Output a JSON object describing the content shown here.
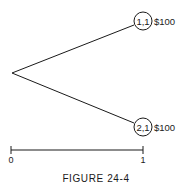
{
  "figure": {
    "caption": "FIGURE 24-4",
    "root": {
      "x": 12,
      "y": 73
    },
    "nodes": [
      {
        "id": "node-1-1",
        "label": "1,1",
        "value": "$100",
        "cx": 143,
        "cy": 21
      },
      {
        "id": "node-2-1",
        "label": "2,1",
        "value": "$100",
        "cx": 143,
        "cy": 127
      }
    ],
    "scale": {
      "start_label": "0",
      "end_label": "1",
      "x0": 11,
      "x1": 143,
      "y": 150
    }
  },
  "colors": {
    "ink": "#1a1a1a",
    "background": "#ffffff"
  }
}
